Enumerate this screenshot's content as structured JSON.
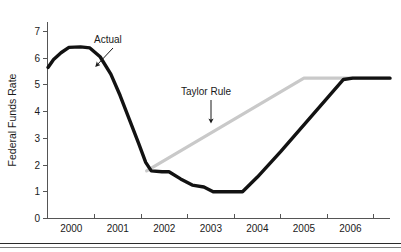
{
  "chart_data": {
    "type": "line",
    "title": "",
    "xlabel": "",
    "ylabel": "Federal Funds Rate",
    "xlim": [
      1999.5,
      2006.85
    ],
    "ylim": [
      0,
      7.35
    ],
    "grid": false,
    "legend_position": "inline-annotations",
    "y_ticks": [
      "0",
      "1",
      "2",
      "3",
      "4",
      "5",
      "6",
      "7"
    ],
    "y_tick_values": [
      0,
      1,
      2,
      3,
      4,
      5,
      6,
      7
    ],
    "x_ticks": [
      "2000",
      "2001",
      "2002",
      "2003",
      "2004",
      "2005",
      "2006"
    ],
    "x_tick_values": [
      2000,
      2001,
      2002,
      2003,
      2004,
      2005,
      2006
    ],
    "series": [
      {
        "name": "Actual",
        "color": "#121212",
        "points": [
          [
            1999.5,
            5.65
          ],
          [
            1999.62,
            5.95
          ],
          [
            1999.78,
            6.2
          ],
          [
            1999.95,
            6.4
          ],
          [
            2000.2,
            6.42
          ],
          [
            2000.4,
            6.38
          ],
          [
            2000.62,
            6.05
          ],
          [
            2000.85,
            5.4
          ],
          [
            2001.05,
            4.6
          ],
          [
            2001.25,
            3.7
          ],
          [
            2001.45,
            2.8
          ],
          [
            2001.6,
            2.1
          ],
          [
            2001.72,
            1.78
          ],
          [
            2001.95,
            1.75
          ],
          [
            2002.1,
            1.75
          ],
          [
            2002.35,
            1.48
          ],
          [
            2002.6,
            1.25
          ],
          [
            2002.85,
            1.18
          ],
          [
            2003.05,
            1.0
          ],
          [
            2003.5,
            1.0
          ],
          [
            2003.68,
            1.0
          ],
          [
            2004.0,
            1.55
          ],
          [
            2004.5,
            2.5
          ],
          [
            2005.0,
            3.5
          ],
          [
            2005.5,
            4.5
          ],
          [
            2005.85,
            5.2
          ],
          [
            2006.05,
            5.25
          ],
          [
            2006.85,
            5.25
          ]
        ]
      },
      {
        "name": "Taylor Rule",
        "color": "#c9c9c9",
        "points": [
          [
            2001.62,
            1.78
          ],
          [
            2005.0,
            5.25
          ],
          [
            2006.85,
            5.25
          ]
        ]
      }
    ],
    "annotations": [
      {
        "text": "Actual",
        "label_x": 94,
        "label_y": 43,
        "arrow_from_x": 113,
        "arrow_from_y": 48,
        "arrow_to_x": 97,
        "arrow_to_y": 65
      },
      {
        "text": "Taylor Rule",
        "label_x": 181,
        "label_y": 95,
        "arrow_from_x": 211,
        "arrow_from_y": 100,
        "arrow_to_x": 211,
        "arrow_to_y": 121
      }
    ]
  }
}
